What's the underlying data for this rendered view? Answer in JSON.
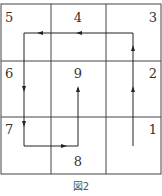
{
  "figure": {
    "caption": "図2",
    "grid": {
      "rows": 3,
      "cols": 3
    },
    "cells": [
      {
        "label": "5",
        "row": 0,
        "col": 0,
        "align": "left"
      },
      {
        "label": "4",
        "row": 0,
        "col": 1,
        "align": "center"
      },
      {
        "label": "3",
        "row": 0,
        "col": 2,
        "align": "right"
      },
      {
        "label": "6",
        "row": 1,
        "col": 0,
        "align": "left"
      },
      {
        "label": "9",
        "row": 1,
        "col": 1,
        "align": "center"
      },
      {
        "label": "2",
        "row": 1,
        "col": 2,
        "align": "right"
      },
      {
        "label": "7",
        "row": 2,
        "col": 0,
        "align": "left"
      },
      {
        "label": "8",
        "row": 2,
        "col": 1,
        "align": "center"
      },
      {
        "label": "1",
        "row": 2,
        "col": 2,
        "align": "right"
      }
    ],
    "path_description": "Path starting in cell 1 going up through 2 and 3, left through 4 to 5, down through 6 to 7, right into 8, and up into 9",
    "colors": {
      "line": "#333333",
      "path": "#222222",
      "text": "#333333"
    }
  }
}
